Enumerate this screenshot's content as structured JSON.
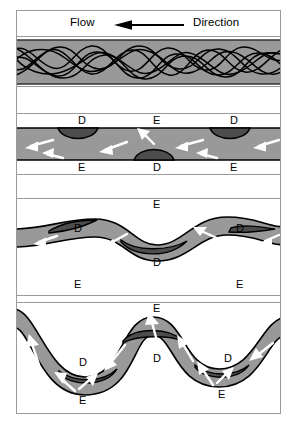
{
  "figure": {
    "header": {
      "left_text": "Flow",
      "right_text": "Direction",
      "arrow_icon": "left-arrow-icon",
      "arrow_direction": "left"
    },
    "legend_codes": {
      "D": "Deposition",
      "E": "Erosion"
    },
    "colors": {
      "channel_fill": "#999999",
      "deposit_fill": "#4d4d4d",
      "outline": "#000000",
      "arrow": "#ffffff",
      "frame": "#9a9a9a",
      "background": "#ffffff"
    },
    "panels": [
      {
        "id": "panel-1",
        "name": "braided-channel-stage",
        "description": "Straight braided reach with anastomosing thalweg lines",
        "labels": []
      },
      {
        "id": "panel-2",
        "name": "incipient-pool-riffle-stage",
        "description": "Straight channel with alternating bars; flow begins to swing",
        "labels": [
          {
            "text": "D",
            "side": "top",
            "x": 61,
            "y": 3
          },
          {
            "text": "E",
            "side": "top",
            "x": 136,
            "y": 3
          },
          {
            "text": "D",
            "side": "top",
            "x": 213,
            "y": 3
          },
          {
            "text": "E",
            "side": "bottom",
            "x": 61,
            "y": 48
          },
          {
            "text": "D",
            "side": "bottom",
            "x": 136,
            "y": 48
          },
          {
            "text": "E",
            "side": "bottom",
            "x": 213,
            "y": 48
          }
        ]
      },
      {
        "id": "panel-3",
        "name": "developing-meander-stage",
        "description": "Sinuous channel with point bars on inner banks and cut banks on outer banks",
        "labels": [
          {
            "text": "E",
            "side": "top",
            "x": 136,
            "y": 2
          },
          {
            "text": "D",
            "side": "top",
            "x": 57,
            "y": 26
          },
          {
            "text": "D",
            "side": "top",
            "x": 219,
            "y": 26
          },
          {
            "text": "D",
            "side": "bottom",
            "x": 136,
            "y": 57
          },
          {
            "text": "E",
            "side": "bottom",
            "x": 57,
            "y": 79
          },
          {
            "text": "E",
            "side": "bottom",
            "x": 219,
            "y": 79
          }
        ]
      },
      {
        "id": "panel-4",
        "name": "mature-meander-stage",
        "description": "Fully developed meander loops with pronounced point-bar deposition",
        "labels": [
          {
            "text": "E",
            "side": "top",
            "x": 136,
            "y": 2
          },
          {
            "text": "D",
            "side": "top",
            "x": 136,
            "y": 52
          },
          {
            "text": "D",
            "side": "top",
            "x": 62,
            "y": 56
          },
          {
            "text": "D",
            "side": "top",
            "x": 207,
            "y": 52
          },
          {
            "text": "E",
            "side": "bottom",
            "x": 62,
            "y": 94
          },
          {
            "text": "E",
            "side": "bottom",
            "x": 201,
            "y": 88
          }
        ]
      }
    ]
  }
}
